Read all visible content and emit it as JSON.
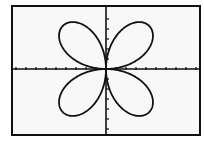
{
  "chart_data": {
    "type": "line",
    "title": "",
    "subtitle": "",
    "xlabel": "",
    "ylabel": "",
    "equation": "r = a·sin(2θ)",
    "curve": "four-petal polar rose",
    "petals": 4,
    "amplitude_units": 6.2,
    "theta_range": [
      0,
      6.2832
    ],
    "xlim": [
      -9.5,
      9.5
    ],
    "ylim": [
      -6.5,
      6.5
    ],
    "x_tick_step": 1,
    "y_tick_step": 1.5,
    "grid": false,
    "axes_visible": true,
    "legend": null,
    "colors": {
      "curve": "#111111",
      "axes": "#111111",
      "background": "#f8f8f8",
      "border": "#111111"
    }
  },
  "screen": {
    "left": 11,
    "top": 5,
    "width": 190,
    "height": 131,
    "origin_px": [
      106,
      69
    ],
    "px_per_unit_x": 10,
    "px_per_unit_y": 10,
    "amplitude_px": 61
  },
  "labels": {
    "graph_description": "Graphing calculator screen showing a four-leaf rose curve centered at the origin"
  }
}
